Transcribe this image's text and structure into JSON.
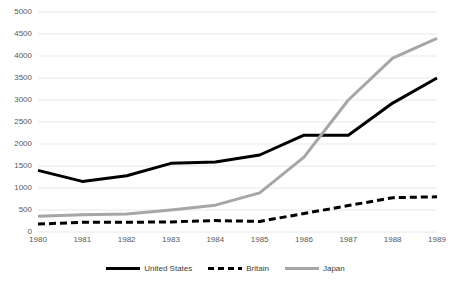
{
  "chart_data": {
    "type": "line",
    "title": "",
    "subtitle": "",
    "xlabel": "",
    "ylabel": "",
    "categories": [
      "1980",
      "1981",
      "1982",
      "1983",
      "1984",
      "1985",
      "1986",
      "1987",
      "1988",
      "1989"
    ],
    "x": [
      1980,
      1981,
      1982,
      1983,
      1984,
      1985,
      1986,
      1987,
      1988,
      1989
    ],
    "xlim": [
      1980,
      1989
    ],
    "ylim": [
      0,
      5000
    ],
    "ytick_labels": [
      "5000",
      "4500",
      "4000",
      "3500",
      "3000",
      "2500",
      "2000",
      "1500",
      "1000",
      "500",
      "0"
    ],
    "yticks": [
      5000,
      4500,
      4000,
      3500,
      3000,
      2500,
      2000,
      1500,
      1000,
      500,
      0
    ],
    "grid": "horizontal",
    "legend_position": "bottom",
    "series": [
      {
        "name": "United States",
        "values": [
          1400,
          1150,
          1280,
          1560,
          1590,
          1750,
          2200,
          2200,
          2930,
          3500
        ],
        "color": "#000000",
        "style": "solid",
        "width": 3
      },
      {
        "name": "Britain",
        "values": [
          180,
          220,
          220,
          230,
          260,
          240,
          420,
          600,
          780,
          800
        ],
        "color": "#000000",
        "style": "dashed",
        "width": 3
      },
      {
        "name": "Japan",
        "values": [
          360,
          390,
          410,
          500,
          610,
          890,
          1700,
          3000,
          3950,
          4400
        ],
        "color": "#a6a6a6",
        "style": "solid",
        "width": 3
      }
    ]
  },
  "legend": {
    "items": [
      {
        "label": "United States",
        "swatch": "solid-black-line-swatch"
      },
      {
        "label": "Britain",
        "swatch": "dashed-black-line-swatch"
      },
      {
        "label": "Japan",
        "swatch": "solid-gray-line-swatch"
      }
    ]
  },
  "colors": {
    "united_states": "#000000",
    "britain": "#000000",
    "japan": "#a6a6a6",
    "gridline": "#e8e8e8",
    "text": "#595959",
    "background": "#ffffff"
  }
}
